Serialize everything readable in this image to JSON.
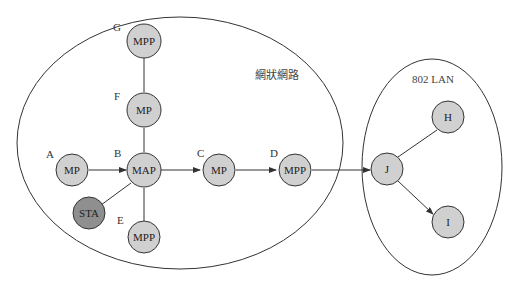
{
  "colors": {
    "node_fill": "#d0d0d0",
    "sta_fill": "#8f8f8f",
    "stroke": "#333333"
  },
  "regions": {
    "mesh": {
      "title": "網狀網路"
    },
    "lan": {
      "title": "802 LAN"
    }
  },
  "nodes": {
    "A": {
      "letter": "A",
      "type": "MP"
    },
    "B": {
      "letter": "B",
      "type": "MAP"
    },
    "C": {
      "letter": "C",
      "type": "MP"
    },
    "D": {
      "letter": "D",
      "type": "MPP"
    },
    "E": {
      "letter": "E",
      "type": "MPP"
    },
    "F": {
      "letter": "F",
      "type": "MP"
    },
    "G": {
      "letter": "G",
      "type": "MPP"
    },
    "STA": {
      "type": "STA"
    },
    "H": {
      "type": "H"
    },
    "I": {
      "type": "I"
    },
    "J": {
      "type": "J"
    }
  },
  "edges": [
    {
      "from": "A",
      "to": "B",
      "arrow": true
    },
    {
      "from": "B",
      "to": "C",
      "arrow": true
    },
    {
      "from": "C",
      "to": "D",
      "arrow": true
    },
    {
      "from": "D",
      "to": "J",
      "arrow": true
    },
    {
      "from": "B",
      "to": "F",
      "arrow": false
    },
    {
      "from": "F",
      "to": "G",
      "arrow": false
    },
    {
      "from": "B",
      "to": "E",
      "arrow": false
    },
    {
      "from": "B",
      "to": "STA",
      "arrow": false
    },
    {
      "from": "J",
      "to": "H",
      "arrow": false
    },
    {
      "from": "J",
      "to": "I",
      "arrow": true
    }
  ]
}
